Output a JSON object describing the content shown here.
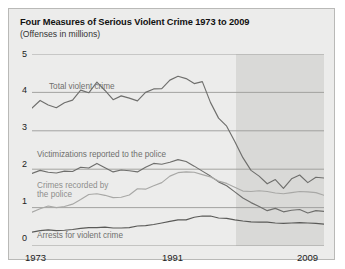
{
  "figure": {
    "title": "Four Measures of Serious Violent Crime 1973 to 2009",
    "subtitle": "(Offenses in millions)"
  },
  "axis": {
    "y_ticks": [
      "5",
      "4",
      "3",
      "2",
      "1",
      "0"
    ],
    "x_ticks": [
      "1973",
      "1991",
      "2009"
    ]
  },
  "labels": {
    "total": "Total violent crime",
    "victimizations": "Victimizations reported to the police",
    "recorded_line1": "Crimes recorded by",
    "recorded_line2": "the police",
    "arrests": "Arrests for violent crime"
  },
  "colors": {
    "panel_bg": "#ececeb",
    "shade_bg": "#d9d9d7",
    "gridline": "#9b9b99",
    "line_total": "#6f6f6d",
    "line_victim": "#6f6f6d",
    "line_recorded": "#a8a8a6",
    "line_arrests": "#5a5a58",
    "border": "#b9b9b7"
  },
  "chart_data": {
    "type": "line",
    "title": "Four Measures of Serious Violent Crime 1973 to 2009",
    "subtitle": "(Offenses in millions)",
    "xlabel": "",
    "ylabel": "Offenses in millions",
    "xlim": [
      1973,
      2009
    ],
    "ylim": [
      0,
      5
    ],
    "grid": true,
    "legend": "inline-labels",
    "annotations": [
      {
        "text": "Shaded region marks later years of the series (approx. 1998-2009)",
        "type": "shaded-band",
        "x_start": 1998,
        "x_end": 2009
      }
    ],
    "x": [
      1973,
      1974,
      1975,
      1976,
      1977,
      1978,
      1979,
      1980,
      1981,
      1982,
      1983,
      1984,
      1985,
      1986,
      1987,
      1988,
      1989,
      1990,
      1991,
      1992,
      1993,
      1994,
      1995,
      1996,
      1997,
      1998,
      1999,
      2000,
      2001,
      2002,
      2003,
      2004,
      2005,
      2006,
      2007,
      2008,
      2009
    ],
    "series": [
      {
        "name": "Total violent crime",
        "color": "#6f6f6d",
        "values": [
          3.59,
          3.79,
          3.67,
          3.6,
          3.73,
          3.8,
          4.06,
          3.99,
          4.27,
          4.05,
          3.81,
          3.91,
          3.85,
          3.78,
          4.0,
          4.09,
          4.1,
          4.32,
          4.42,
          4.36,
          4.23,
          4.28,
          3.74,
          3.33,
          3.12,
          2.72,
          2.3,
          1.97,
          1.82,
          1.62,
          1.73,
          1.5,
          1.75,
          1.85,
          1.65,
          1.79,
          1.77
        ]
      },
      {
        "name": "Victimizations reported to the police",
        "color": "#6f6f6d",
        "values": [
          1.89,
          1.97,
          1.92,
          1.9,
          1.95,
          1.94,
          2.05,
          2.03,
          2.15,
          2.04,
          1.93,
          1.98,
          1.96,
          1.93,
          2.05,
          2.15,
          2.13,
          2.18,
          2.25,
          2.2,
          2.08,
          1.95,
          1.82,
          1.67,
          1.57,
          1.41,
          1.25,
          1.13,
          1.03,
          0.92,
          0.98,
          0.89,
          0.93,
          0.95,
          0.86,
          0.92,
          0.9
        ]
      },
      {
        "name": "Crimes recorded by the police",
        "color": "#a8a8a6",
        "values": [
          0.88,
          0.97,
          1.04,
          1.0,
          1.03,
          1.09,
          1.21,
          1.34,
          1.36,
          1.32,
          1.26,
          1.27,
          1.33,
          1.49,
          1.48,
          1.57,
          1.65,
          1.82,
          1.91,
          1.93,
          1.92,
          1.86,
          1.8,
          1.69,
          1.63,
          1.53,
          1.43,
          1.42,
          1.44,
          1.42,
          1.38,
          1.36,
          1.39,
          1.42,
          1.41,
          1.39,
          1.32
        ]
      },
      {
        "name": "Arrests for violent crime",
        "color": "#5a5a58",
        "values": [
          0.36,
          0.4,
          0.42,
          0.4,
          0.41,
          0.43,
          0.46,
          0.48,
          0.48,
          0.49,
          0.47,
          0.47,
          0.48,
          0.52,
          0.53,
          0.56,
          0.6,
          0.64,
          0.68,
          0.68,
          0.75,
          0.78,
          0.78,
          0.73,
          0.72,
          0.68,
          0.65,
          0.63,
          0.62,
          0.62,
          0.6,
          0.59,
          0.6,
          0.61,
          0.6,
          0.59,
          0.57
        ]
      }
    ]
  }
}
